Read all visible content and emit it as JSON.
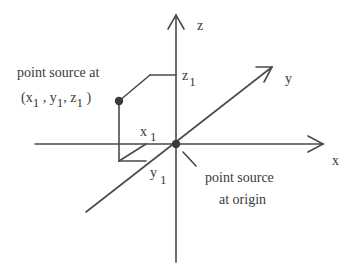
{
  "diagram": {
    "axes": {
      "x": {
        "label": "x"
      },
      "y": {
        "label": "y"
      },
      "z": {
        "label": "z"
      }
    },
    "point_source": {
      "caption_line1": "point source at",
      "coords": {
        "x": "x",
        "x_sub": "1",
        "y": "y",
        "y_sub": "1",
        "z": "z",
        "z_sub": "1"
      }
    },
    "projections": {
      "x1": {
        "main": "x",
        "sub": "1"
      },
      "y1": {
        "main": "y",
        "sub": "1"
      },
      "z1": {
        "main": "z",
        "sub": "1"
      }
    },
    "origin_source": {
      "caption_line1": "point source",
      "caption_line2": "at origin"
    },
    "colors": {
      "line": "#4a4a4a",
      "text": "#3a3a3a",
      "background": "#ffffff"
    }
  }
}
